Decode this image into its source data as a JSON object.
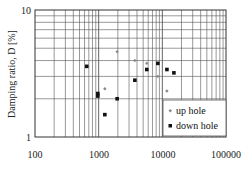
{
  "chart_data": {
    "type": "scatter",
    "title": "",
    "xlabel": "",
    "ylabel": "Damping ratio, D [%]",
    "xscale": "log",
    "yscale": "log",
    "xlim": [
      100,
      100000
    ],
    "ylim": [
      1,
      10
    ],
    "x_tick_labels": [
      "100",
      "1000",
      "10000",
      "100000"
    ],
    "y_tick_labels": [
      "1",
      "10"
    ],
    "grid": true,
    "legend_position": "lower right",
    "series": [
      {
        "name": "up hole",
        "marker": "small-diamond",
        "color": "#888888",
        "points": [
          [
            1250,
            2.4
          ],
          [
            1950,
            4.7
          ],
          [
            3700,
            4.0
          ],
          [
            5700,
            3.8
          ],
          [
            8500,
            3.0
          ],
          [
            11800,
            2.3
          ]
        ]
      },
      {
        "name": "down hole",
        "marker": "square",
        "color": "#111111",
        "points": [
          [
            650,
            3.6
          ],
          [
            970,
            2.2
          ],
          [
            970,
            2.1
          ],
          [
            1250,
            1.5
          ],
          [
            1950,
            2.0
          ],
          [
            3700,
            2.8
          ],
          [
            5700,
            3.4
          ],
          [
            8500,
            3.8
          ],
          [
            11800,
            3.4
          ],
          [
            15200,
            3.2
          ]
        ]
      }
    ]
  },
  "labels": {
    "ylabel": "Damping ratio, D [%]",
    "y_top": "10",
    "y_bottom": "1",
    "x_ticks": [
      "100",
      "1000",
      "10000",
      "100000"
    ],
    "legend_up": "up hole",
    "legend_down": "down hole"
  }
}
